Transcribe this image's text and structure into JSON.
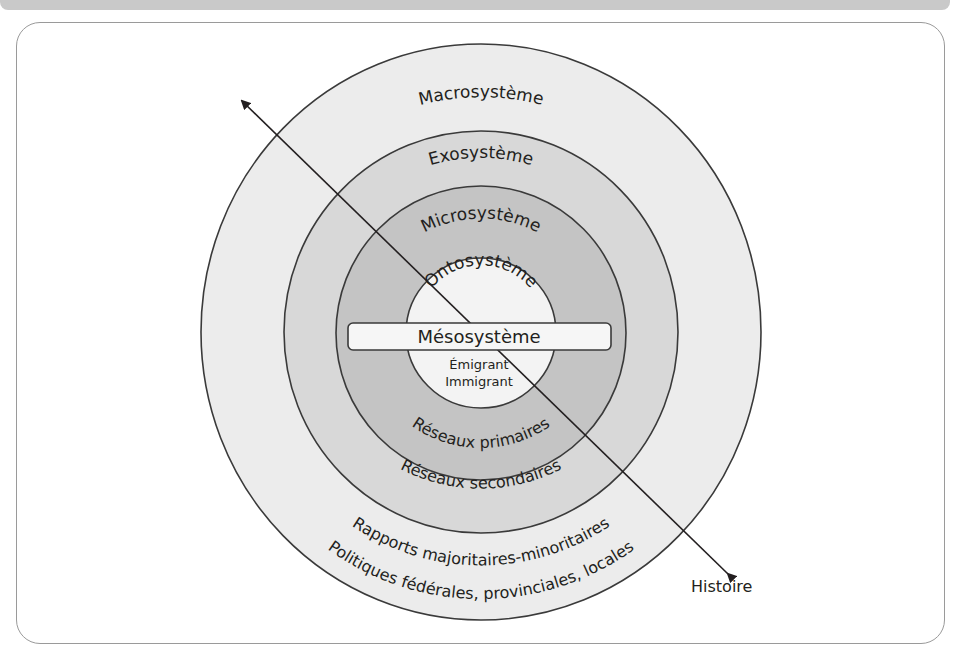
{
  "diagram": {
    "layers": [
      {
        "id": "macro",
        "label": "Macrosystème",
        "fill": "#ececec"
      },
      {
        "id": "exo",
        "label": "Exosystème",
        "fill": "#d8d8d8"
      },
      {
        "id": "micro",
        "label": "Microsystème",
        "fill": "#c4c4c4"
      },
      {
        "id": "onto",
        "label": "Ontosystème",
        "fill": "#f3f3f3"
      }
    ],
    "meso_label": "Mésosystème",
    "center_lines": [
      "Émigrant",
      "Immigrant"
    ],
    "micro_bottom_label": "Réseaux primaires",
    "exo_bottom_label": "Réseaux secondaires",
    "macro_bottom_labels": [
      "Rapports majoritaires-minoritaires",
      "Politiques fédérales, provinciales, locales"
    ],
    "arrow_label": "Histoire",
    "colors": {
      "stroke": "#3a3a3a",
      "text": "#231f20",
      "top_band": "#c9c9c9",
      "panel_border": "#9a9a9a"
    }
  }
}
